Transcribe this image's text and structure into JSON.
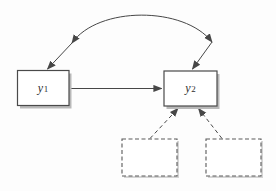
{
  "figure": {
    "type": "path-diagram",
    "background_color": "#fdfdfd",
    "line_color": "#474747",
    "box_border_color": "#4a4a4a",
    "box_fill_color": "#ffffff",
    "shadow_color": "#b9b9b9",
    "nodes": [
      {
        "id": "y1",
        "label_base": "y",
        "label_sub": "1",
        "border": "solid"
      },
      {
        "id": "y2",
        "label_base": "y",
        "label_sub": "2",
        "border": "solid"
      },
      {
        "id": "unlabeled-left",
        "label_base": "",
        "label_sub": "",
        "border": "dashed"
      },
      {
        "id": "unlabeled-right",
        "label_base": "",
        "label_sub": "",
        "border": "dashed"
      }
    ],
    "edges": [
      {
        "type": "curved-double-headed-arrow",
        "between": [
          "y1",
          "y2"
        ]
      },
      {
        "type": "single-headed-arrow",
        "from": "y1",
        "to": "y2"
      },
      {
        "type": "dashed-arrow",
        "from": "unlabeled-left",
        "to": "y2"
      },
      {
        "type": "dashed-arrow",
        "from": "unlabeled-right",
        "to": "y2"
      }
    ]
  }
}
